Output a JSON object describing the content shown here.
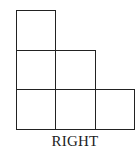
{
  "diagram": {
    "view_label": "RIGHT",
    "grid": {
      "origin_x": 16,
      "origin_y": 10,
      "cell_size": 40,
      "rows": [
        [
          1,
          0,
          0
        ],
        [
          1,
          1,
          0
        ],
        [
          1,
          1,
          1
        ]
      ]
    },
    "line_color": "#222222",
    "background": "#ffffff"
  }
}
